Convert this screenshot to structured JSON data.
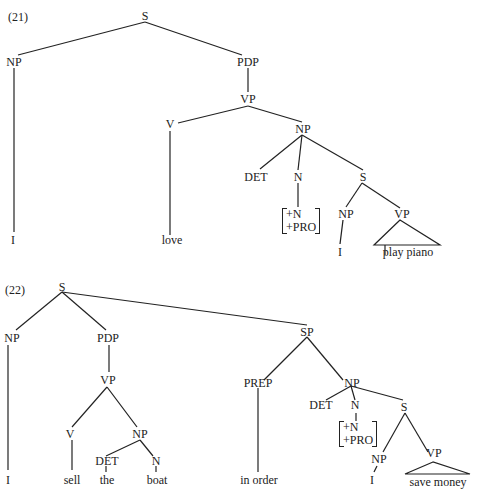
{
  "tree21": {
    "number": "(21)",
    "labels": {
      "S": "S",
      "NP": "NP",
      "PDP": "PDP",
      "VP": "VP",
      "V": "V",
      "NP2": "NP",
      "DET": "DET",
      "N": "N",
      "S2": "S",
      "NP3": "NP",
      "VP2": "VP",
      "feat1": "+N",
      "feat2": "+PRO",
      "I": "I",
      "love": "love",
      "I2": "I",
      "play_piano": "play piano"
    }
  },
  "tree22": {
    "number": "(22)",
    "labels": {
      "S": "S",
      "NP": "NP",
      "PDP": "PDP",
      "VP": "VP",
      "V": "V",
      "NP2": "NP",
      "DET": "DET",
      "N": "N",
      "SP": "SP",
      "PREP": "PREP",
      "NP3": "NP",
      "DET2": "DET",
      "N2": "N",
      "S2": "S",
      "NP4": "NP",
      "VP2": "VP",
      "feat1": "+N",
      "feat2": "+PRO",
      "I": "I",
      "sell": "sell",
      "the": "the",
      "boat": "boat",
      "in_order": "in order",
      "I2": "I",
      "save_money": "save money"
    }
  }
}
